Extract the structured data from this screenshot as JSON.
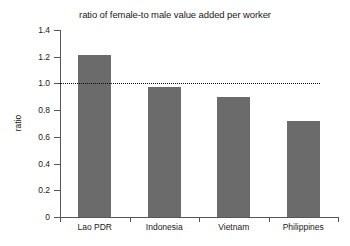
{
  "chart_data": {
    "type": "bar",
    "title": "ratio of female-to male value added per worker",
    "xlabel": "",
    "ylabel": "ratio",
    "categories": [
      "Lao PDR",
      "Indonesia",
      "Vietnam",
      "Philippines"
    ],
    "values": [
      1.21,
      0.97,
      0.9,
      0.72
    ],
    "ylim": [
      0,
      1.4
    ],
    "yticks": [
      "0",
      "0.2",
      "0.4",
      "0.6",
      "0.8",
      "1.0",
      "1.2",
      "1.4"
    ],
    "ytick_values": [
      0,
      0.2,
      0.4,
      0.6,
      0.8,
      1.0,
      1.2,
      1.4
    ],
    "grid": false,
    "legend": false,
    "bar_color": "#6b6b6b",
    "axis_color": "#555555",
    "annotations": [
      {
        "name": "parity-reference-line",
        "type": "horizontal-dotted-line",
        "value": 1.0,
        "color": "#111111"
      }
    ]
  }
}
